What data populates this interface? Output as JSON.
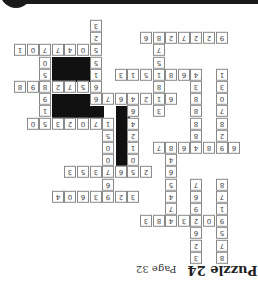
{
  "page": {
    "title": "Puzzle 24",
    "page_label": "Page 32",
    "orientation": "rotated 180 degrees"
  },
  "grid": {
    "origin_x": 14,
    "origin_y": 20,
    "pitch_x": 12.6,
    "pitch_y": 12.2,
    "cells": [
      [
        0,
        6,
        "3"
      ],
      [
        1,
        6,
        "2"
      ],
      [
        2,
        0,
        "1"
      ],
      [
        2,
        1,
        "0"
      ],
      [
        2,
        2,
        "7"
      ],
      [
        2,
        3,
        "7"
      ],
      [
        2,
        4,
        "4"
      ],
      [
        2,
        5,
        "0"
      ],
      [
        2,
        6,
        "5"
      ],
      [
        3,
        2,
        "0"
      ],
      [
        3,
        6,
        "5"
      ],
      [
        3,
        11,
        "5"
      ],
      [
        4,
        2,
        "5"
      ],
      [
        4,
        6,
        "1"
      ],
      [
        4,
        8,
        "3"
      ],
      [
        4,
        9,
        "1"
      ],
      [
        4,
        10,
        "5"
      ],
      [
        4,
        11,
        "1"
      ],
      [
        4,
        12,
        "8"
      ],
      [
        4,
        13,
        "6"
      ],
      [
        4,
        14,
        "4"
      ],
      [
        4,
        16,
        "1"
      ],
      [
        1,
        10,
        "6"
      ],
      [
        1,
        11,
        "8"
      ],
      [
        1,
        12,
        "2"
      ],
      [
        1,
        13,
        "7"
      ],
      [
        1,
        14,
        "2"
      ],
      [
        1,
        15,
        "2"
      ],
      [
        1,
        16,
        "9"
      ],
      [
        2,
        11,
        "7"
      ],
      [
        5,
        0,
        "8"
      ],
      [
        5,
        1,
        "9"
      ],
      [
        5,
        2,
        "8"
      ],
      [
        5,
        3,
        "2"
      ],
      [
        5,
        4,
        "7"
      ],
      [
        5,
        5,
        "5"
      ],
      [
        5,
        6,
        "6"
      ],
      [
        5,
        11,
        "8"
      ],
      [
        5,
        14,
        "3"
      ],
      [
        5,
        16,
        "3"
      ],
      [
        6,
        2,
        "9"
      ],
      [
        6,
        6,
        "6"
      ],
      [
        6,
        7,
        "7"
      ],
      [
        6,
        8,
        "6"
      ],
      [
        6,
        9,
        "4"
      ],
      [
        6,
        10,
        "2"
      ],
      [
        6,
        11,
        "1"
      ],
      [
        6,
        12,
        "6"
      ],
      [
        6,
        14,
        "8"
      ],
      [
        6,
        16,
        "0"
      ],
      [
        7,
        2,
        "1"
      ],
      [
        7,
        9,
        "6"
      ],
      [
        7,
        11,
        "3"
      ],
      [
        7,
        14,
        "8"
      ],
      [
        7,
        16,
        "7"
      ],
      [
        8,
        1,
        "0"
      ],
      [
        8,
        2,
        "5"
      ],
      [
        8,
        3,
        "3"
      ],
      [
        8,
        4,
        "2"
      ],
      [
        8,
        5,
        "0"
      ],
      [
        8,
        6,
        "7"
      ],
      [
        8,
        7,
        "1"
      ],
      [
        8,
        9,
        "4"
      ],
      [
        8,
        14,
        "8"
      ],
      [
        8,
        16,
        "8"
      ],
      [
        9,
        7,
        "5"
      ],
      [
        9,
        9,
        "2"
      ],
      [
        9,
        14,
        "8"
      ],
      [
        9,
        16,
        "2"
      ],
      [
        10,
        7,
        "0"
      ],
      [
        10,
        9,
        "1"
      ],
      [
        10,
        11,
        "7"
      ],
      [
        10,
        12,
        "8"
      ],
      [
        10,
        13,
        "6"
      ],
      [
        10,
        14,
        "4"
      ],
      [
        10,
        15,
        "8"
      ],
      [
        10,
        16,
        "9"
      ],
      [
        10,
        17,
        "6"
      ],
      [
        11,
        7,
        "0"
      ],
      [
        11,
        9,
        "0"
      ],
      [
        11,
        12,
        "4"
      ],
      [
        12,
        4,
        "3"
      ],
      [
        12,
        5,
        "5"
      ],
      [
        12,
        6,
        "3"
      ],
      [
        12,
        7,
        "7"
      ],
      [
        12,
        8,
        "6"
      ],
      [
        12,
        9,
        "5"
      ],
      [
        12,
        10,
        "2"
      ],
      [
        12,
        12,
        "6"
      ],
      [
        13,
        7,
        "6"
      ],
      [
        13,
        12,
        "5"
      ],
      [
        13,
        14,
        "7"
      ],
      [
        13,
        16,
        "8"
      ],
      [
        14,
        3,
        "4"
      ],
      [
        14,
        4,
        "0"
      ],
      [
        14,
        5,
        "6"
      ],
      [
        14,
        6,
        "3"
      ],
      [
        14,
        7,
        "9"
      ],
      [
        14,
        8,
        "2"
      ],
      [
        14,
        9,
        "3"
      ],
      [
        14,
        12,
        "4"
      ],
      [
        14,
        14,
        "6"
      ],
      [
        14,
        16,
        "7"
      ],
      [
        15,
        12,
        "7"
      ],
      [
        15,
        14,
        "9"
      ],
      [
        15,
        16,
        "1"
      ],
      [
        16,
        10,
        "3"
      ],
      [
        16,
        11,
        "8"
      ],
      [
        16,
        12,
        "4"
      ],
      [
        16,
        13,
        "3"
      ],
      [
        16,
        14,
        "2"
      ],
      [
        16,
        15,
        "0"
      ],
      [
        16,
        16,
        "9"
      ],
      [
        17,
        14,
        "6"
      ],
      [
        17,
        16,
        "5"
      ],
      [
        18,
        14,
        "2"
      ],
      [
        18,
        16,
        "7"
      ],
      [
        19,
        14,
        "3"
      ],
      [
        19,
        16,
        "8"
      ]
    ],
    "black_blocks": [
      {
        "x": 52,
        "y": 57,
        "w": 38,
        "h": 25
      },
      {
        "x": 52,
        "y": 94,
        "w": 38,
        "h": 12
      },
      {
        "x": 52,
        "y": 106,
        "w": 52,
        "h": 12
      },
      {
        "x": 116,
        "y": 106,
        "w": 14,
        "h": 12
      },
      {
        "x": 116,
        "y": 118,
        "w": 14,
        "h": 49
      }
    ]
  }
}
